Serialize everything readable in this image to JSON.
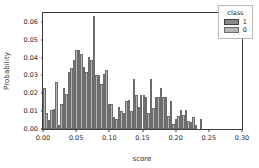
{
  "chart_data": {
    "type": "bar",
    "title": "",
    "subtitle": "",
    "xlabel": "score",
    "ylabel": "Probability",
    "xlim": [
      0.0,
      0.3
    ],
    "ylim": [
      0.0,
      0.065
    ],
    "xticks": [
      "0.00",
      "0.05",
      "0.10",
      "0.15",
      "0.20",
      "0.25",
      "0.30"
    ],
    "xtick_values": [
      0.0,
      0.05,
      0.1,
      0.15,
      0.2,
      0.25,
      0.3
    ],
    "yticks": [
      "0.00",
      "0.01",
      "0.02",
      "0.03",
      "0.04",
      "0.05",
      "0.06"
    ],
    "ytick_values": [
      0.0,
      0.01,
      0.02,
      0.03,
      0.04,
      0.05,
      0.06
    ],
    "grid": false,
    "bin_width": 0.00375,
    "legend": {
      "title": "class",
      "position": "top-right",
      "entries": [
        {
          "label": "1",
          "color": "#8a8a8a"
        },
        {
          "label": "0",
          "color": "#b6b6b6"
        }
      ]
    },
    "series": [
      {
        "name": "0",
        "color": "#b6b6b6",
        "x": [
          0.0019,
          0.0056,
          0.0094,
          0.0131,
          0.0169,
          0.0206,
          0.0244,
          0.0281,
          0.0319,
          0.0356,
          0.0394,
          0.0431,
          0.0469,
          0.0506,
          0.0544,
          0.0581,
          0.0619,
          0.0656,
          0.0694,
          0.0731,
          0.0769,
          0.0806,
          0.0844,
          0.0881,
          0.0919,
          0.0956,
          0.0994,
          0.1031,
          0.1069,
          0.1106,
          0.1144,
          0.1181,
          0.1219,
          0.1256,
          0.1294,
          0.1331,
          0.1369,
          0.1406,
          0.1444,
          0.1481,
          0.1519,
          0.1556,
          0.1594,
          0.1631,
          0.1669,
          0.1706,
          0.1744,
          0.1781,
          0.1819,
          0.1856,
          0.1894,
          0.1931,
          0.1969,
          0.2006,
          0.2044,
          0.2081,
          0.2119,
          0.2156,
          0.2194,
          0.2231,
          0.2269,
          0.2306,
          0.2344,
          0.2381,
          0.2419,
          0.2456,
          0.2494,
          0.2531,
          0.2569,
          0.2606,
          0.2644,
          0.2681,
          0.2719,
          0.2756,
          0.2794,
          0.2831,
          0.2869,
          0.2906
        ],
        "values": [
          0.0228,
          0.0089,
          0.0052,
          0.0108,
          0.011,
          0.0262,
          0.0022,
          0.014,
          0.0229,
          0.0196,
          0.0318,
          0.0342,
          0.0388,
          0.044,
          0.044,
          0.0418,
          0.0348,
          0.0317,
          0.0402,
          0.0388,
          0.0631,
          0.03,
          0.03,
          0.025,
          0.0308,
          0.0331,
          0.0141,
          0.014,
          0.0065,
          0.0055,
          0.0122,
          0.01,
          0.009,
          0.0158,
          0.016,
          0.01,
          0.028,
          0.0193,
          0.0124,
          0.0188,
          0.019,
          0.018,
          0.009,
          0.028,
          0.0116,
          0.018,
          0.0178,
          0.023,
          0.0178,
          0.0178,
          0.0073,
          0.0158,
          0.003,
          0.0058,
          0.0075,
          0.0105,
          0.008,
          0.0108,
          0.0043,
          0.004,
          0.007,
          0.0022,
          0.0,
          0.0055,
          0.0,
          0.0,
          0.0,
          0.0,
          0.0,
          0.0,
          0.0,
          0.0,
          0.0,
          0.0,
          0.0,
          0.0,
          0.0,
          0.0
        ]
      },
      {
        "name": "1",
        "color": "#8a8a8a",
        "x": [
          0.0544,
          0.0581,
          0.0619,
          0.0656,
          0.0694,
          0.0731,
          0.0769,
          0.0806,
          0.0844,
          0.0881,
          0.0919,
          0.0956,
          0.0994,
          0.1031,
          0.1069,
          0.1106,
          0.1144,
          0.1181,
          0.1219,
          0.1256,
          0.1294,
          0.1331,
          0.1369,
          0.1406,
          0.1444,
          0.1481,
          0.1519,
          0.1556,
          0.1594,
          0.1631,
          0.1669,
          0.1706,
          0.1744,
          0.1781,
          0.1819,
          0.1856,
          0.1894,
          0.1931,
          0.1969,
          0.2006,
          0.2044,
          0.2081,
          0.2119,
          0.2156,
          0.2194,
          0.2231,
          0.2269,
          0.2306,
          0.2344,
          0.2381,
          0.2419,
          0.2456,
          0.2494,
          0.2531,
          0.2569,
          0.2606,
          0.2644,
          0.2681,
          0.2719,
          0.2756,
          0.2794,
          0.2831,
          0.2869,
          0.2906
        ],
        "values": [
          0.0022,
          0.0022,
          0.0022,
          0.0022,
          0.0022,
          0.0022,
          0.0022,
          0.0038,
          0.0038,
          0.0038,
          0.0022,
          0.0022,
          0.0038,
          0.0038,
          0.0022,
          0.0022,
          0.0055,
          0.0055,
          0.0038,
          0.0038,
          0.009,
          0.0055,
          0.0038,
          0.0055,
          0.0055,
          0.0055,
          0.0055,
          0.0038,
          0.0022,
          0.0038,
          0.0038,
          0.0038,
          0.0038,
          0.0022,
          0.0038,
          0.0038,
          0.0022,
          0.0022,
          0.0022,
          0.0022,
          0.0022,
          0.0022,
          0.0022,
          0.0022,
          0.0022,
          0.0022,
          0.0022,
          0.0022,
          0.0,
          0.0,
          0.0,
          0.0,
          0.0,
          0.0,
          0.0,
          0.0,
          0.0,
          0.0,
          0.0,
          0.0,
          0.0,
          0.0,
          0.0,
          0.0
        ]
      }
    ]
  }
}
